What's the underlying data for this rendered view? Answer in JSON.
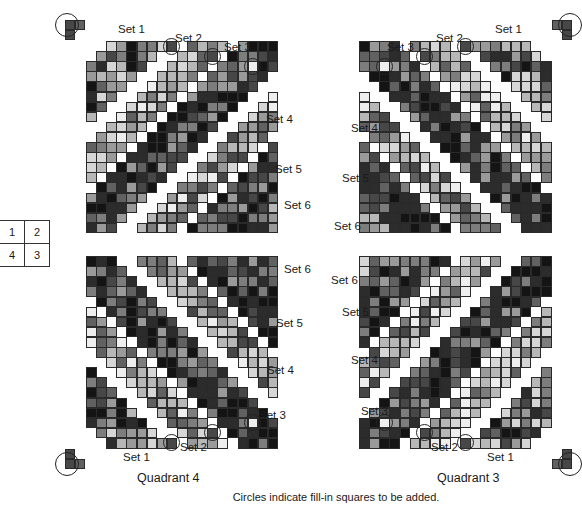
{
  "key_grid": {
    "cells": [
      [
        "1",
        "2"
      ],
      [
        "4",
        "3"
      ]
    ]
  },
  "caption": "Circles indicate fill-in squares to be added.",
  "palette": [
    "#141414",
    "#2c2c2c",
    "#474747",
    "#616161",
    "#7d7d7d",
    "#9a9a9a",
    "#b7b7b7",
    "#d6d6d6",
    "#eeeeee"
  ],
  "grid": {
    "cell_size": 10.1,
    "cols": 19,
    "rows": 19
  },
  "canonical_sets": [
    {
      "name": "Set 1",
      "s_min": 2,
      "s_max": 7,
      "tone": "dark-mixed"
    },
    {
      "name": "Set 2",
      "s_min": 10,
      "s_max": 13,
      "tone": "light"
    },
    {
      "name": "Set 3",
      "s_min": 15,
      "s_max": 20,
      "tone": "dark"
    },
    {
      "name": "Set 4",
      "s_min": 23,
      "s_max": 26,
      "tone": "light-mixed"
    },
    {
      "name": "Set 5",
      "s_min": 28,
      "s_max": 33,
      "tone": "dark"
    },
    {
      "name": "Set 6",
      "s_min": 34,
      "s_max": 36,
      "tone": "mixed"
    }
  ],
  "canonical_circles": [
    {
      "set": "Set 1",
      "c": -1.9,
      "r": -1.6,
      "d": 24,
      "cells": [
        [
          -2.1,
          -2.1
        ],
        [
          -1.1,
          -2.1
        ],
        [
          -2.1,
          -1.1
        ]
      ]
    },
    {
      "set": "Set 1",
      "c": 8,
      "r": 0,
      "d": 17
    },
    {
      "set": "Set 2",
      "c": 12,
      "r": 1,
      "d": 17
    },
    {
      "set": "Set 3",
      "c": 16,
      "r": 2,
      "d": 17
    }
  ],
  "quadrants": [
    {
      "id": "1",
      "label": "",
      "origin_x": 86,
      "origin_y": 41,
      "flip_x": false,
      "flip_y": false,
      "set_labels": [
        {
          "text": "Set 1",
          "x": 118,
          "y": 24
        },
        {
          "text": "Set 2",
          "x": 175,
          "y": 33
        },
        {
          "text": "Set 3",
          "x": 224,
          "y": 42
        },
        {
          "text": "Set 4",
          "x": 266,
          "y": 114
        },
        {
          "text": "Set 5",
          "x": 275,
          "y": 164
        },
        {
          "text": "Set 6",
          "x": 284,
          "y": 200
        }
      ]
    },
    {
      "id": "2",
      "label": "",
      "origin_x": 551,
      "origin_y": 41,
      "flip_x": true,
      "flip_y": false,
      "set_labels": [
        {
          "text": "Set 1",
          "x": 495,
          "y": 24
        },
        {
          "text": "Set 2",
          "x": 436,
          "y": 33
        },
        {
          "text": "Set 3",
          "x": 387,
          "y": 42
        },
        {
          "text": "Set 4",
          "x": 351,
          "y": 123
        },
        {
          "text": "Set 5",
          "x": 342,
          "y": 173
        },
        {
          "text": "Set 6",
          "x": 334,
          "y": 221
        }
      ]
    },
    {
      "id": "4",
      "label": "Quadrant 4",
      "label_x": 137,
      "label_y": 472,
      "origin_x": 86,
      "origin_y": 448,
      "flip_x": false,
      "flip_y": true,
      "set_labels": [
        {
          "text": "Set 1",
          "x": 123,
          "y": 452
        },
        {
          "text": "Set 2",
          "x": 180,
          "y": 442
        },
        {
          "text": "Set 3",
          "x": 259,
          "y": 410
        },
        {
          "text": "Set 4",
          "x": 267,
          "y": 365
        },
        {
          "text": "Set 5",
          "x": 276,
          "y": 318
        },
        {
          "text": "Set 6",
          "x": 284,
          "y": 264
        }
      ]
    },
    {
      "id": "3",
      "label": "Quadrant 3",
      "label_x": 437,
      "label_y": 472,
      "origin_x": 551,
      "origin_y": 448,
      "flip_x": true,
      "flip_y": true,
      "set_labels": [
        {
          "text": "Set 1",
          "x": 487,
          "y": 452
        },
        {
          "text": "Set 2",
          "x": 431,
          "y": 442
        },
        {
          "text": "Set 3",
          "x": 361,
          "y": 406
        },
        {
          "text": "Set 4",
          "x": 351,
          "y": 355
        },
        {
          "text": "Set 5",
          "x": 342,
          "y": 307
        },
        {
          "text": "Set 6",
          "x": 331,
          "y": 275
        }
      ]
    }
  ]
}
